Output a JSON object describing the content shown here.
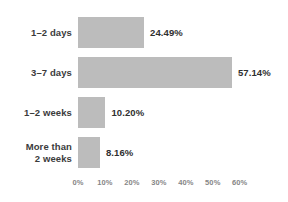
{
  "chart_data": {
    "type": "bar",
    "orientation": "horizontal",
    "title": "",
    "subtitle": "",
    "xlabel": "",
    "ylabel": "",
    "categories": [
      "1–2 days",
      "3–7 days",
      "1–2 weeks",
      "More than\n2 weeks"
    ],
    "values": [
      24.49,
      57.14,
      10.2,
      8.16
    ],
    "value_labels": [
      "24.49%",
      "57.14%",
      "10.20%",
      "8.16%"
    ],
    "xlim": [
      0,
      60
    ],
    "xticks": [
      0,
      10,
      20,
      30,
      40,
      50,
      60
    ],
    "xtick_labels": [
      "0%",
      "10%",
      "20%",
      "30%",
      "40%",
      "50%",
      "60%"
    ],
    "grid": false,
    "legend": false,
    "bar_color": "#bcbcbc",
    "label_color": "#3b3b3b",
    "value_color": "#2f2f2f",
    "tick_color": "#868686",
    "background": "#ffffff"
  }
}
